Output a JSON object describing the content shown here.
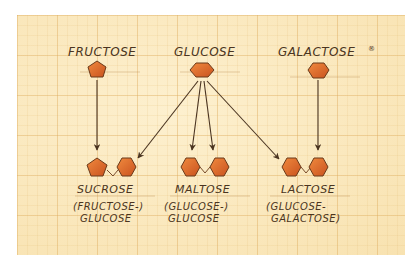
{
  "diagram": {
    "colors": {
      "paper": "#fbe9bf",
      "grid": "#deaa5a",
      "ink": "#4a3420",
      "sugar_fill": "#e0682a",
      "sugar_stroke": "#6b3a1a"
    },
    "monosaccharides": [
      {
        "id": "fructose",
        "label": "FRUCTOSE",
        "shape": "pentagon"
      },
      {
        "id": "glucose",
        "label": "GLUCOSE",
        "shape": "hexagon"
      },
      {
        "id": "galactose",
        "label": "GALACTOSE",
        "shape": "hexagon",
        "note_mark": "®"
      }
    ],
    "disaccharides": [
      {
        "id": "sucrose",
        "label": "SUCROSE",
        "composition_line1": "(FRUCTOSE-)",
        "composition_line2": "GLUCOSE",
        "units": [
          "pentagon",
          "hexagon"
        ]
      },
      {
        "id": "maltose",
        "label": "MALTOSE",
        "composition_line1": "(GLUCOSE-)",
        "composition_line2": "GLUCOSE",
        "units": [
          "hexagon",
          "hexagon"
        ]
      },
      {
        "id": "lactose",
        "label": "LACTOSE",
        "composition_line1": "(GLUCOSE-",
        "composition_line2": "GALACTOSE)",
        "units": [
          "hexagon",
          "hexagon"
        ]
      }
    ],
    "edges": [
      {
        "from": "fructose",
        "to": "sucrose"
      },
      {
        "from": "glucose",
        "to": "sucrose"
      },
      {
        "from": "glucose",
        "to": "maltose"
      },
      {
        "from": "glucose",
        "to": "maltose"
      },
      {
        "from": "glucose",
        "to": "lactose"
      },
      {
        "from": "galactose",
        "to": "lactose"
      }
    ]
  }
}
